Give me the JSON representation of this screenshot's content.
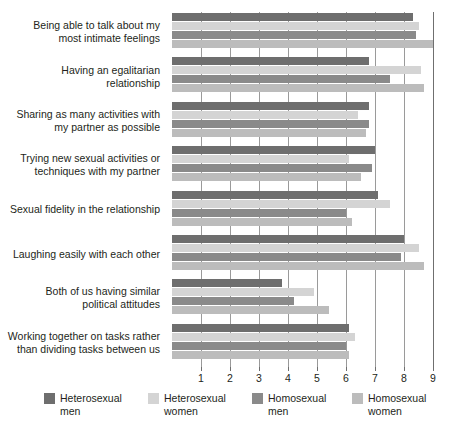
{
  "chart_data": {
    "type": "bar",
    "orientation": "horizontal",
    "title": "",
    "xlabel": "",
    "ylabel": "",
    "xlim": [
      0,
      9
    ],
    "xticks": [
      1,
      2,
      3,
      4,
      5,
      6,
      7,
      8,
      9
    ],
    "grid": true,
    "legend_position": "bottom",
    "categories": [
      "Being able to talk about my\nmost intimate feelings",
      "Having an egalitarian\nrelationship",
      "Sharing as many activities with\nmy partner as possible",
      "Trying new sexual activities or\ntechniques with my partner",
      "Sexual fidelity in the relationship",
      "Laughing easily with each other",
      "Both of us having similar\npolitical attitudes",
      "Working together on tasks rather\nthan dividing tasks between us"
    ],
    "series": [
      {
        "name": "Heterosexual men",
        "color": "#6e6e6e",
        "values": [
          8.3,
          6.8,
          6.8,
          7.0,
          7.1,
          8.0,
          3.8,
          6.1
        ]
      },
      {
        "name": "Heterosexual women",
        "color": "#d4d4d4",
        "values": [
          8.5,
          8.6,
          6.4,
          6.1,
          7.5,
          8.5,
          4.9,
          6.3
        ]
      },
      {
        "name": "Homosexual men",
        "color": "#8a8a8a",
        "values": [
          8.4,
          7.5,
          6.8,
          6.9,
          6.0,
          7.9,
          4.2,
          6.0
        ]
      },
      {
        "name": "Homosexual women",
        "color": "#bcbcbc",
        "values": [
          9.0,
          8.7,
          6.7,
          6.5,
          6.2,
          8.7,
          5.4,
          6.1
        ]
      }
    ]
  },
  "legend": {
    "items": [
      {
        "label": "Heterosexual\nmen",
        "color": "#6e6e6e",
        "left": 0
      },
      {
        "label": "Heterosexual\nwomen",
        "color": "#d4d4d4",
        "left": 104
      },
      {
        "label": "Homosexual\nmen",
        "color": "#8a8a8a",
        "left": 208
      },
      {
        "label": "Homosexual\nwomen",
        "color": "#bcbcbc",
        "left": 308
      }
    ]
  },
  "axis": {
    "tick_labels": [
      "1",
      "2",
      "3",
      "4",
      "5",
      "6",
      "7",
      "8",
      "9"
    ]
  }
}
